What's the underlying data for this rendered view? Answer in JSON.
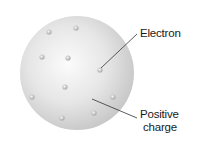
{
  "labels": {
    "electron": "Electron",
    "positive_charge_line1": "Positive",
    "positive_charge_line2": "charge"
  },
  "sphere": {
    "cx": 77,
    "cy": 73,
    "r": 57,
    "color_light": "#f7f7f7",
    "color_dark": "#c9c9c9"
  },
  "electrons": [
    {
      "x": 49,
      "y": 32
    },
    {
      "x": 76,
      "y": 28
    },
    {
      "x": 42,
      "y": 57
    },
    {
      "x": 68,
      "y": 58
    },
    {
      "x": 100,
      "y": 70
    },
    {
      "x": 65,
      "y": 87
    },
    {
      "x": 32,
      "y": 97
    },
    {
      "x": 113,
      "y": 97
    },
    {
      "x": 62,
      "y": 118
    },
    {
      "x": 94,
      "y": 113
    }
  ],
  "leader_lines": {
    "electron": {
      "x1": 101,
      "y1": 68,
      "x2": 137,
      "y2": 34
    },
    "positive_charge": {
      "x1": 92,
      "y1": 99,
      "x2": 137,
      "y2": 118
    }
  }
}
